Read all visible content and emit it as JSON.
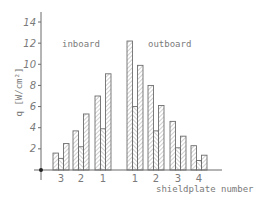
{
  "chart_data": {
    "type": "bar",
    "title": "",
    "ylabel": "q [W/cm²]",
    "xlabel": "shieldplate number",
    "ylim": [
      0,
      14
    ],
    "yticks": [
      2,
      4,
      6,
      8,
      10,
      12,
      14
    ],
    "grid": false,
    "annotations": [
      "inboard",
      "outboard"
    ],
    "bar_style": {
      "outer_bars": "hatched (forward diagonal)",
      "middle_bar": "hatched (back diagonal)"
    },
    "groups": [
      {
        "region": "inboard",
        "label": "3",
        "values": [
          1.6,
          1.1,
          2.5
        ]
      },
      {
        "region": "inboard",
        "label": "2",
        "values": [
          3.7,
          2.2,
          5.3
        ]
      },
      {
        "region": "inboard",
        "label": "1",
        "values": [
          7.0,
          3.9,
          9.1
        ]
      },
      {
        "region": "outboard",
        "label": "1",
        "values": [
          12.2,
          6.0,
          9.9
        ]
      },
      {
        "region": "outboard",
        "label": "2",
        "values": [
          8.0,
          3.7,
          6.1
        ]
      },
      {
        "region": "outboard",
        "label": "3",
        "values": [
          4.6,
          2.1,
          3.2
        ]
      },
      {
        "region": "outboard",
        "label": "4",
        "values": [
          2.3,
          0.9,
          1.4
        ]
      }
    ],
    "colors": {
      "stroke": "#6e6e6e",
      "text": "#7a7a7a"
    }
  }
}
